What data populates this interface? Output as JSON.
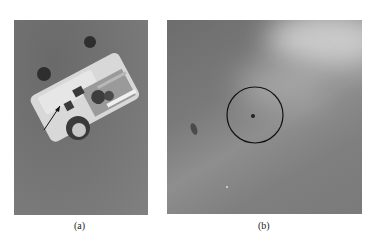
{
  "figure": {
    "panels": [
      {
        "id": "a",
        "label": "(a)",
        "content": "small wheeled robot on gray floor with arrow pointing to its side"
      },
      {
        "id": "b",
        "label": "(b)",
        "content": "gray textured floor with circled small dark spot"
      }
    ]
  }
}
